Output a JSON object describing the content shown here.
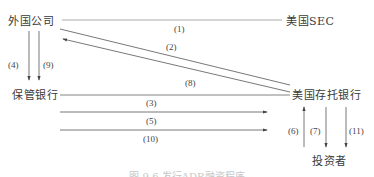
{
  "nodes": {
    "foreign_company": "外国公司",
    "us_sec": "美国SEC",
    "custodian_bank": "保管银行",
    "us_depositary_bank": "美国存托银行",
    "investors": "投资者"
  },
  "flows": [
    {
      "id": "1",
      "label": "(1)",
      "from": "外国公司",
      "to": "美国SEC"
    },
    {
      "id": "2",
      "label": "(2)",
      "from": "外国公司",
      "to": "美国存托银行"
    },
    {
      "id": "3",
      "label": "(3)",
      "from": "保管银行",
      "to": "美国存托银行"
    },
    {
      "id": "4",
      "label": "(4)",
      "from": "外国公司",
      "to": "保管银行"
    },
    {
      "id": "5",
      "label": "(5)",
      "from": "保管银行",
      "to": "美国存托银行"
    },
    {
      "id": "6",
      "label": "(6)",
      "from": "投资者",
      "to": "美国存托银行"
    },
    {
      "id": "7",
      "label": "(7)",
      "from": "美国存托银行",
      "to": "投资者"
    },
    {
      "id": "8",
      "label": "(8)",
      "from": "美国存托银行",
      "to": "外国公司"
    },
    {
      "id": "9",
      "label": "(9)",
      "from": "外国公司",
      "to": "保管银行"
    },
    {
      "id": "10",
      "label": "(10)",
      "from": "保管银行",
      "to": "美国存托银行"
    },
    {
      "id": "11",
      "label": "(11)",
      "from": "美国存托银行",
      "to": "投资者"
    }
  ],
  "caption": "图 9-6 发行ADR融资程序"
}
